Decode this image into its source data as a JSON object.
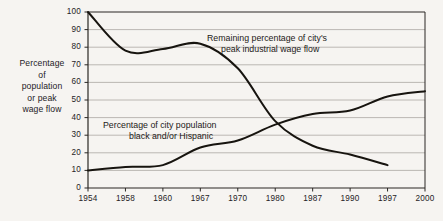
{
  "axis_title": {
    "lines": [
      "Percentage",
      "of",
      "population",
      "or peak",
      "wage flow"
    ]
  },
  "annotations": {
    "wage": {
      "line1": "Remaining percentage of city's",
      "line2": "peak industrial wage flow"
    },
    "population": {
      "line1": "Percentage of city population",
      "line2": "black and/or Hispanic"
    }
  },
  "caption": "",
  "colors": {
    "background": "#f6f4f1",
    "gridline": "#b4b0ab",
    "axis": "#2a2724",
    "curve": "#17140f",
    "text": "#25221f"
  },
  "chart_data": {
    "type": "line",
    "title": "",
    "xlabel": "",
    "ylabel": "Percentage of population or peak wage flow",
    "ylim": [
      0,
      100
    ],
    "ytick_labels": [
      "0",
      "10",
      "20",
      "30",
      "40",
      "50",
      "60",
      "70",
      "80",
      "90",
      "100"
    ],
    "yticks": [
      0,
      10,
      20,
      30,
      40,
      50,
      60,
      70,
      80,
      90,
      100
    ],
    "grid": true,
    "legend": "inline-annotations",
    "categories": [
      "1954",
      "1958",
      "1960",
      "1967",
      "1970",
      "1980",
      "1987",
      "1990",
      "1997",
      "2000"
    ],
    "series": [
      {
        "name": "Remaining percentage of city's peak industrial wage flow",
        "x": [
          "1954",
          "1958",
          "1960",
          "1967",
          "1970",
          "1980",
          "1987",
          "1990",
          "1997"
        ],
        "values": [
          100,
          78,
          79,
          82,
          68,
          38,
          24,
          19,
          13
        ]
      },
      {
        "name": "Percentage of city population black and/or Hispanic",
        "x": [
          "1954",
          "1958",
          "1960",
          "1967",
          "1970",
          "1980",
          "1987",
          "1990",
          "1997",
          "2000"
        ],
        "values": [
          10,
          12,
          13,
          23,
          27,
          36,
          42,
          44,
          52,
          55
        ]
      }
    ]
  }
}
